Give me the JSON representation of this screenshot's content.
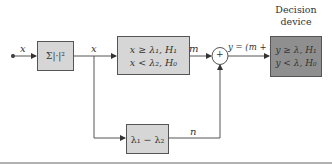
{
  "diagram": {
    "input_label": "x",
    "junction_label": "x",
    "blocks": {
      "energy": {
        "label": "Σ|·|²",
        "fill": "#d6d6d6"
      },
      "threshold": {
        "line1": "x ≥ λ₁, H₁",
        "line2": "x < λ₂, H₀",
        "fill": "#d6d6d6"
      },
      "difference": {
        "label": "λ₁ − λ₂",
        "fill": "#d6d6d6"
      },
      "summer": {
        "label": "+"
      },
      "decision": {
        "title_line1": "Decision",
        "title_line2": "device",
        "line1": "y ≥ λ, H₁",
        "line2": "y < λ, H₀",
        "fill": "#8f8f8f"
      }
    },
    "signals": {
      "m": "m",
      "n": "n",
      "y": "y = (m + n)"
    },
    "colors": {
      "line": "#555555",
      "rule": "#999999"
    }
  }
}
